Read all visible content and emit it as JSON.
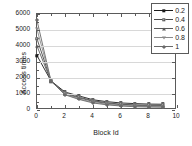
{
  "chart_data": {
    "type": "line",
    "title": "",
    "xlabel": "Block Id",
    "ylabel": "Access times",
    "xlim": [
      0,
      10
    ],
    "ylim": [
      0,
      6000
    ],
    "xticks": [
      0,
      2,
      4,
      6,
      8,
      10
    ],
    "xtick_labels": [
      "0",
      "2",
      "4",
      "6",
      "8",
      "10"
    ],
    "yticks": [
      0,
      1000,
      2000,
      3000,
      4000,
      5000,
      6000
    ],
    "ytick_labels": [
      "0",
      "1000",
      "2000",
      "3000",
      "4000",
      "5000",
      "6000"
    ],
    "grid": "horizontal",
    "legend_position": "upper right",
    "x": [
      0,
      1,
      2,
      3,
      4,
      5,
      6,
      7,
      8,
      9
    ],
    "series": [
      {
        "name": "0.2",
        "marker": "filled-square",
        "color": "#1c1c1c",
        "values": [
          3400,
          1820,
          1120,
          880,
          640,
          520,
          440,
          400,
          370,
          360
        ]
      },
      {
        "name": "0.4",
        "marker": "open-square",
        "color": "#4a4a4a",
        "values": [
          4450,
          1800,
          1050,
          800,
          580,
          450,
          360,
          320,
          300,
          290
        ]
      },
      {
        "name": "0.6",
        "marker": "triangle-up",
        "color": "#5a5a5a",
        "values": [
          4000,
          1790,
          1000,
          760,
          540,
          410,
          330,
          290,
          265,
          255
        ]
      },
      {
        "name": "0.8",
        "marker": "triangle-down",
        "color": "#8a8a8a",
        "values": [
          5050,
          1800,
          980,
          700,
          480,
          360,
          280,
          240,
          215,
          205
        ]
      },
      {
        "name": "1",
        "marker": "diamond",
        "color": "#6a6a6a",
        "values": [
          5600,
          1810,
          950,
          660,
          440,
          320,
          250,
          205,
          185,
          175
        ]
      }
    ]
  },
  "legend": {
    "items": [
      {
        "label": "0.2"
      },
      {
        "label": "0.4"
      },
      {
        "label": "0.6"
      },
      {
        "label": "0.8"
      },
      {
        "label": "1"
      }
    ]
  }
}
